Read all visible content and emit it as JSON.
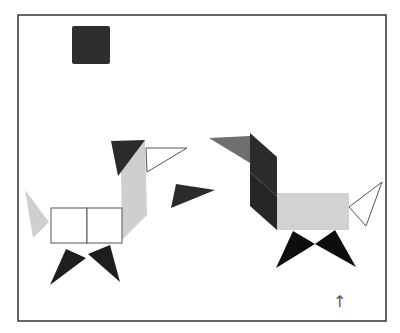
{
  "canvas": {
    "width": 400,
    "height": 333,
    "background": "#ffffff",
    "frame": {
      "x": 18,
      "y": 15,
      "width": 368,
      "height": 306,
      "stroke": "#333333"
    }
  },
  "colors": {
    "dark": "#2b2b2b",
    "black": "#111111",
    "mid_grey": "#6f6f6f",
    "light_grey": "#cfcfcf",
    "outline": "#555555",
    "white": "#ffffff"
  },
  "loose_pieces": {
    "square": {
      "x": 72,
      "y": 26,
      "size": 38,
      "color": "#2e2e2e"
    },
    "triangle": {
      "points": "176,184 215,190 171,208",
      "color": "#2b2b2b"
    }
  },
  "left_figure": {
    "label": "dog-left",
    "head": {
      "points": "111,141 145,140 118,176",
      "color": "#2b2b2b"
    },
    "beak": {
      "points": "146,148 187,148 147,172",
      "color": "#ffffff"
    },
    "neck": {
      "points": "145,140 147,215 122,240 121,168",
      "color": "#cfcfcf"
    },
    "body_left": {
      "x": 51,
      "y": 208,
      "width": 36,
      "height": 35
    },
    "body_right": {
      "x": 87,
      "y": 208,
      "width": 35,
      "height": 35
    },
    "tail": {
      "points": "25,190 49,222 33,238",
      "color": "#cfcfcf"
    },
    "leg_left": {
      "points": "66,249 86,258 50,285",
      "color": "#1e1e1e"
    },
    "leg_right": {
      "points": "88,254 110,245 120,282",
      "color": "#1e1e1e"
    }
  },
  "right_figure": {
    "label": "dog-right",
    "beak": {
      "points": "209,138 250,136 250,163",
      "color": "#6f6f6f"
    },
    "neck_upper": {
      "points": "250,133 277,157 277,196 250,172",
      "color": "#2b2b2b"
    },
    "neck_lower": {
      "points": "250,172 277,196 277,230 250,206",
      "color": "#262626"
    },
    "body": {
      "x": 277,
      "y": 193,
      "width": 72,
      "height": 37,
      "color": "#d2d2d2"
    },
    "tail": {
      "points": "349,207 382,182 366,226",
      "color": "#ffffff"
    },
    "leg_left": {
      "points": "293,231 315,244 276,268",
      "color": "#0d0d0d"
    },
    "leg_right": {
      "points": "335,230 315,244 356,267",
      "color": "#0d0d0d"
    }
  },
  "annotation": {
    "arrow": "↑",
    "x": 333,
    "y": 294
  }
}
